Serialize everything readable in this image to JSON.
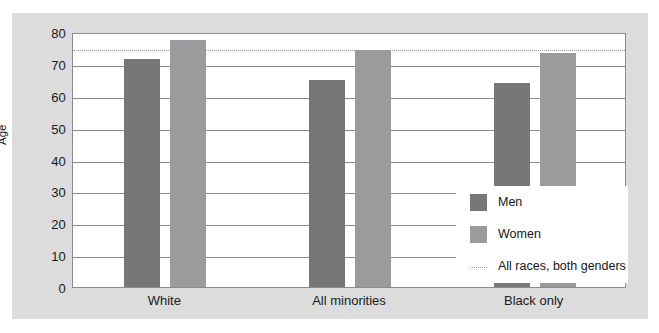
{
  "chart_data": {
    "type": "bar",
    "title": "",
    "xlabel": "",
    "ylabel": "Age",
    "categories": [
      "White",
      "All minorities",
      "Black only"
    ],
    "series": [
      {
        "name": "Men",
        "color": "#77777a",
        "values": [
          71.5,
          65.0,
          64.0
        ]
      },
      {
        "name": "Women",
        "color": "#9b9b9e",
        "values": [
          77.5,
          74.5,
          73.5
        ]
      }
    ],
    "reference_line": {
      "label": "All races, both genders",
      "value": 75,
      "style": "dotted",
      "color": "#9a9a9a"
    },
    "ylim": [
      0,
      80
    ],
    "yticks": [
      0,
      10,
      20,
      30,
      40,
      50,
      60,
      70,
      80
    ],
    "ytick_labels": [
      "0",
      "10",
      "20",
      "30",
      "40",
      "50",
      "60",
      "70",
      "80"
    ],
    "grid": true,
    "grid_axis": "y",
    "legend_position": "lower right",
    "legend_entries": [
      "Men",
      "Women",
      "All races, both genders"
    ]
  },
  "legend": {
    "items": [
      {
        "label": "Men"
      },
      {
        "label": "Women"
      },
      {
        "label": "All races, both genders"
      }
    ]
  },
  "axes": {
    "y_title": "Age"
  }
}
